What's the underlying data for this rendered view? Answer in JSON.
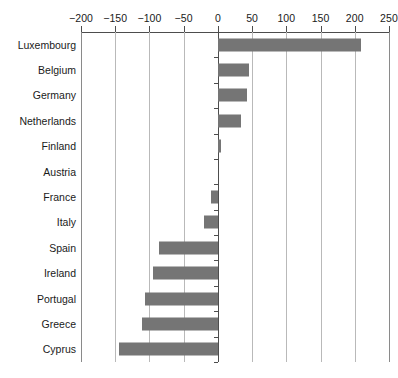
{
  "chart_data": {
    "type": "bar",
    "orientation": "horizontal",
    "title": "",
    "subtitle": "",
    "xlabel": "",
    "ylabel": "",
    "xlim": [
      -200,
      250
    ],
    "ylim": null,
    "grid": true,
    "legend": null,
    "legend_position": "none",
    "bar_color": "#757575",
    "axis_color": "#4d4d4d",
    "gridline_color": "#b9b9b9",
    "xticks": [
      -200,
      -150,
      -100,
      -50,
      0,
      50,
      100,
      150,
      200,
      250
    ],
    "xtick_labels": [
      "−200",
      "−150",
      "−100",
      "−50",
      "0",
      "50",
      "100",
      "150",
      "200",
      "250"
    ],
    "categories": [
      "Luxembourg",
      "Belgium",
      "Germany",
      "Netherlands",
      "Finland",
      "Austria",
      "France",
      "Italy",
      "Spain",
      "Ireland",
      "Portugal",
      "Greece",
      "Cyprus"
    ],
    "values": [
      209,
      46,
      43,
      34,
      4,
      0,
      -10,
      -21,
      -86,
      -95,
      -106,
      -111,
      -145
    ]
  }
}
